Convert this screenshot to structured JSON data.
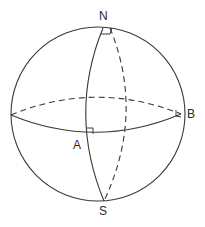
{
  "diagram": {
    "type": "spherical-geometry",
    "labels": {
      "north": "N",
      "south": "S",
      "point_a": "A",
      "point_b": "B"
    },
    "colors": {
      "stroke": "#3a3a3a",
      "background": "#ffffff",
      "text": "#2a2a2a"
    },
    "elements": {
      "sphere_outline": "solid",
      "front_equator": "solid",
      "back_equator": "dashed",
      "front_meridian": "solid",
      "back_meridian": "dashed",
      "right_angle_markers": [
        "N",
        "A",
        "B"
      ]
    }
  }
}
